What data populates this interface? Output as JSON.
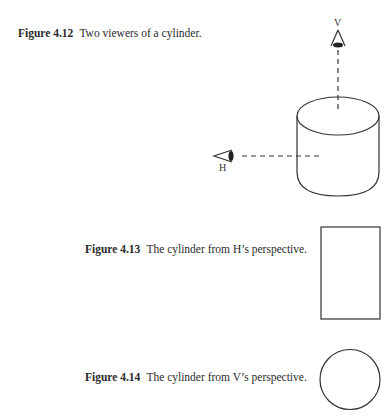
{
  "figures": [
    {
      "label": "Figure 4.12",
      "caption": "Two viewers of a cylinder.",
      "viewers": [
        {
          "name": "V",
          "position": "above",
          "icon": "eye-icon"
        },
        {
          "name": "H",
          "position": "left",
          "icon": "eye-icon"
        }
      ],
      "object": "cylinder"
    },
    {
      "label": "Figure 4.13",
      "caption": "The cylinder from H’s perspective.",
      "shape": "rectangle"
    },
    {
      "label": "Figure 4.14",
      "caption": "The cylinder from V’s perspective.",
      "shape": "circle"
    }
  ],
  "colors": {
    "stroke": "#333333",
    "text": "#2a2a2a",
    "background": "#ffffff"
  }
}
